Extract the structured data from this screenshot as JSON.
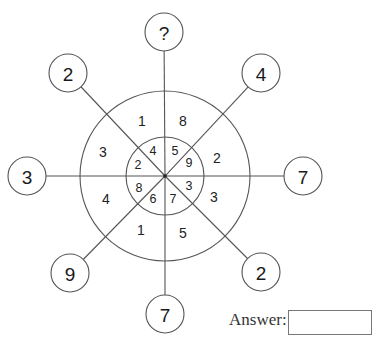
{
  "puzzle": {
    "center": {
      "x": 165,
      "y": 176
    },
    "outer_ring_radius": 85,
    "inner_ring_radius": 39,
    "node_radius": 19,
    "nodes": [
      {
        "position": "top",
        "value": "?",
        "x": 164,
        "y": 32
      },
      {
        "position": "top-right",
        "value": "4",
        "x": 261,
        "y": 73
      },
      {
        "position": "right",
        "value": "7",
        "x": 303,
        "y": 176
      },
      {
        "position": "bottom-right",
        "value": "2",
        "x": 261,
        "y": 272
      },
      {
        "position": "bottom",
        "value": "7",
        "x": 165,
        "y": 314
      },
      {
        "position": "bottom-left",
        "value": "9",
        "x": 70,
        "y": 273
      },
      {
        "position": "left",
        "value": "3",
        "x": 27,
        "y": 176
      },
      {
        "position": "top-left",
        "value": "2",
        "x": 68,
        "y": 73
      }
    ],
    "outer_segments": [
      {
        "value": "1",
        "x": 142,
        "y": 121
      },
      {
        "value": "8",
        "x": 183,
        "y": 121
      },
      {
        "value": "2",
        "x": 217,
        "y": 158
      },
      {
        "value": "3",
        "x": 214,
        "y": 197
      },
      {
        "value": "5",
        "x": 183,
        "y": 233
      },
      {
        "value": "1",
        "x": 141,
        "y": 230
      },
      {
        "value": "4",
        "x": 106,
        "y": 199
      },
      {
        "value": "3",
        "x": 103,
        "y": 152
      }
    ],
    "inner_segments": [
      {
        "value": "4",
        "x": 153,
        "y": 151
      },
      {
        "value": "5",
        "x": 175,
        "y": 151
      },
      {
        "value": "9",
        "x": 189,
        "y": 163
      },
      {
        "value": "3",
        "x": 189,
        "y": 186
      },
      {
        "value": "7",
        "x": 173,
        "y": 199
      },
      {
        "value": "6",
        "x": 153,
        "y": 199
      },
      {
        "value": "8",
        "x": 139,
        "y": 188
      },
      {
        "value": "2",
        "x": 138,
        "y": 165
      }
    ]
  },
  "answer": {
    "label": "Answer:",
    "value": ""
  }
}
